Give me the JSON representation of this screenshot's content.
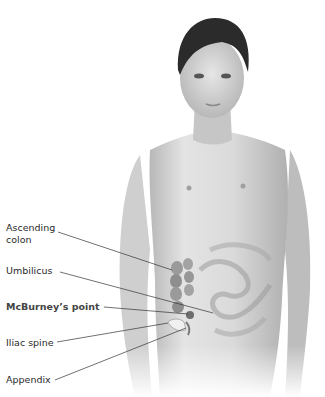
{
  "figure": {
    "labels": [
      {
        "id": "ascending-colon",
        "line1": "Ascending",
        "line2": "colon",
        "bold": false
      },
      {
        "id": "umbilicus",
        "line1": "Umbilicus",
        "bold": false
      },
      {
        "id": "mcburneys-point",
        "line1": "McBurney’s point",
        "bold": true
      },
      {
        "id": "iliac-spine",
        "line1": "Iliac spine",
        "bold": false
      },
      {
        "id": "appendix",
        "line1": "Appendix",
        "bold": false
      }
    ],
    "colors": {
      "background": "#ffffff",
      "skin_light": "#e2e2e2",
      "skin_shadow": "#a8a8a8",
      "hair": "#2b2b2b",
      "leader_line": "#333333",
      "colon": "#9a9a9a"
    }
  }
}
